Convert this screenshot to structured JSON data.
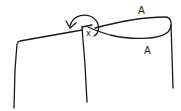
{
  "diagram": {
    "labels": {
      "pivot": "x",
      "loop_top": "A",
      "loop_bottom": "A"
    },
    "stroke_color": "#1a1a1a",
    "background": "#ffffff"
  }
}
